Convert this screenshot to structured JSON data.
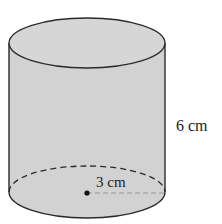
{
  "diagram": {
    "type": "cylinder",
    "labels": {
      "height": "6 cm",
      "radius": "3 cm"
    },
    "colors": {
      "fill": "#d2d2d2",
      "stroke": "#2a2a2a",
      "background": "#ffffff"
    }
  }
}
